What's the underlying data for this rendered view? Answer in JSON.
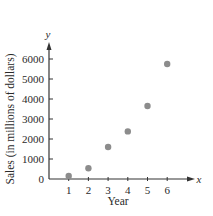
{
  "chart_data": {
    "type": "scatter",
    "title": "",
    "xlabel": "Year",
    "ylabel": "Sales (in millions of dollars)",
    "x_axis_var": "x",
    "y_axis_var": "y",
    "x": [
      1,
      2,
      3,
      4,
      5,
      6
    ],
    "values": [
      150,
      540,
      1600,
      2380,
      3650,
      5750
    ],
    "series": [
      {
        "name": "Sales",
        "x": [
          1,
          2,
          3,
          4,
          5,
          6
        ],
        "values": [
          150,
          540,
          1600,
          2380,
          3650,
          5750
        ]
      }
    ],
    "x_ticks": [
      1,
      2,
      3,
      4,
      5,
      6
    ],
    "y_ticks": [
      0,
      1000,
      2000,
      3000,
      4000,
      5000,
      6000
    ],
    "xlim": [
      0,
      7.5
    ],
    "ylim": [
      0,
      6700
    ],
    "grid": false,
    "legend": "none",
    "marker_color": "#8c8c8c",
    "axis_color": "#333333"
  }
}
